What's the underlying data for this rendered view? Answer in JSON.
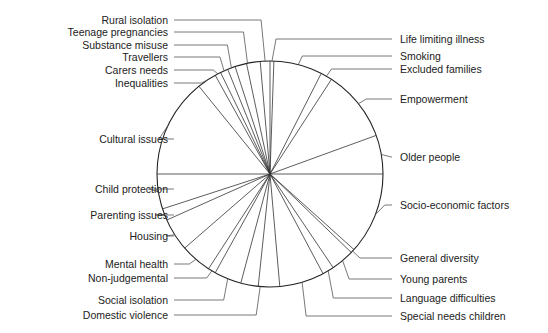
{
  "chart_data": {
    "type": "pie",
    "title": "",
    "center": [
      270,
      174
    ],
    "radius": 113,
    "slice_boundaries_deg_clockwise_from_top": [
      0,
      2,
      27,
      33,
      70,
      90,
      132,
      134,
      146,
      152,
      175,
      186,
      195,
      209,
      213,
      229,
      246,
      252,
      270,
      321,
      331,
      334,
      338,
      342,
      348,
      355
    ],
    "slices": [
      {
        "label": "Life limiting illness",
        "start": 0,
        "end": 2,
        "side": "right",
        "label_y": 39
      },
      {
        "label": "Smoking",
        "start": 2,
        "end": 27,
        "side": "right",
        "label_y": 56
      },
      {
        "label": "Excluded families",
        "start": 27,
        "end": 33,
        "side": "right",
        "label_y": 69
      },
      {
        "label": "Empowerment",
        "start": 33,
        "end": 70,
        "side": "right",
        "label_y": 99
      },
      {
        "label": "Older people",
        "start": 70,
        "end": 90,
        "side": "right",
        "label_y": 157
      },
      {
        "label": "Socio-economic factors",
        "start": 90,
        "end": 132,
        "side": "right",
        "label_y": 205
      },
      {
        "label": "General diversity",
        "start": 132,
        "end": 134,
        "side": "right",
        "label_y": 258
      },
      {
        "label": "Young parents",
        "start": 134,
        "end": 146,
        "side": "right",
        "label_y": 279
      },
      {
        "label": "Language difficulties",
        "start": 146,
        "end": 152,
        "side": "right",
        "label_y": 298
      },
      {
        "label": "Special needs children",
        "start": 152,
        "end": 175,
        "side": "right",
        "label_y": 316
      },
      {
        "label": "Domestic violence",
        "start": 175,
        "end": 195,
        "side": "left",
        "label_y": 315
      },
      {
        "label": "Social isolation",
        "start": 195,
        "end": 209,
        "side": "left",
        "label_y": 300
      },
      {
        "label": "Non-judgemental",
        "start": 209,
        "end": 213,
        "side": "left",
        "label_y": 278
      },
      {
        "label": "Mental health",
        "start": 213,
        "end": 229,
        "side": "left",
        "label_y": 264
      },
      {
        "label": "Housing",
        "start": 229,
        "end": 246,
        "side": "left",
        "label_y": 236
      },
      {
        "label": "Parenting issues",
        "start": 246,
        "end": 252,
        "side": "left",
        "label_y": 215
      },
      {
        "label": "Child protection",
        "start": 252,
        "end": 270,
        "side": "left",
        "label_y": 189
      },
      {
        "label": "Cultural issues",
        "start": 270,
        "end": 321,
        "side": "left",
        "label_y": 139
      },
      {
        "label": "Inequalities",
        "start": 321,
        "end": 331,
        "side": "left",
        "label_y": 83
      },
      {
        "label": "Carers needs",
        "start": 331,
        "end": 334,
        "side": "left",
        "label_y": 70
      },
      {
        "label": "Travellers",
        "start": 334,
        "end": 338,
        "side": "left",
        "label_y": 57
      },
      {
        "label": "Substance misuse",
        "start": 338,
        "end": 342,
        "side": "left",
        "label_y": 45
      },
      {
        "label": "Teenage pregnancies",
        "start": 342,
        "end": 355,
        "side": "left",
        "label_y": 32
      },
      {
        "label": "Rural isolation",
        "start": 355,
        "end": 360,
        "side": "left",
        "label_y": 20
      }
    ],
    "legend": "none (leader-line labels)",
    "colors": {
      "line": "#333333",
      "text": "#222222",
      "fill": "#ffffff"
    }
  }
}
